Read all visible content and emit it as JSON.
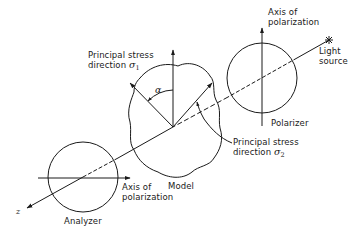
{
  "diagram": {
    "components": {
      "polarizer": {
        "label": "Polarizer",
        "axis_label_line1": "Axis of",
        "axis_label_line2": "polarization"
      },
      "analyzer": {
        "label": "Analyzer",
        "axis_label_line1": "Axis of",
        "axis_label_line2": "polarization"
      },
      "model": {
        "label": "Model"
      },
      "light_source": {
        "label_line1": "Light",
        "label_line2": "source"
      },
      "z_axis": {
        "label": "z"
      }
    },
    "stress": {
      "sigma1": {
        "line1": "Principal stress",
        "line2": "direction",
        "symbol": "σ",
        "subscript": "1"
      },
      "sigma2": {
        "line1": "Principal stress",
        "line2": "direction",
        "symbol": "σ",
        "subscript": "2"
      },
      "angle": {
        "symbol": "α"
      }
    },
    "colors": {
      "line": "#1a1a1a",
      "background": "#ffffff"
    }
  }
}
